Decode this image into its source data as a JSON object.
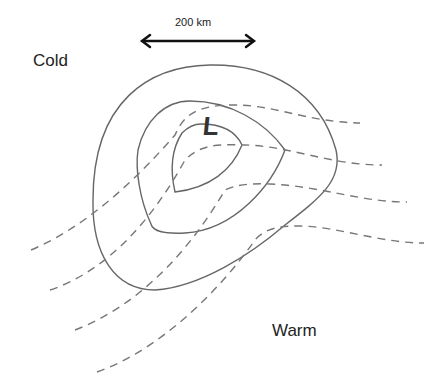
{
  "diagram": {
    "scale_bar": {
      "label": "200 km"
    },
    "center_label": "L",
    "air_mass_labels": {
      "cold": "Cold",
      "warm": "Warm"
    },
    "isobars": {
      "count": 3,
      "style": "solid",
      "color": "#666666"
    },
    "isotherms": {
      "count": 4,
      "style": "dashed",
      "color": "#777777"
    }
  }
}
